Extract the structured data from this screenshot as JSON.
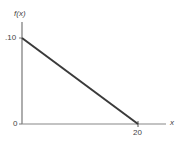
{
  "chart_data": {
    "type": "line",
    "title": "",
    "xlabel": "x",
    "ylabel": "f(x)",
    "x": [
      0,
      20
    ],
    "series": [
      {
        "name": "f(x)",
        "values": [
          0.1,
          0.0
        ]
      }
    ],
    "x_ticks": [
      "20"
    ],
    "y_ticks": [
      ".10",
      "0"
    ],
    "xlim": [
      0,
      20
    ],
    "ylim": [
      0,
      0.1
    ],
    "grid": false,
    "legend": "none",
    "colors": {
      "line": "#3a3a3a",
      "axis": "#777777"
    }
  },
  "labels": {
    "ylabel": "f(x)",
    "xlabel": "x",
    "ytick_top": ".10",
    "ytick_zero": "0",
    "xtick_20": "20"
  }
}
